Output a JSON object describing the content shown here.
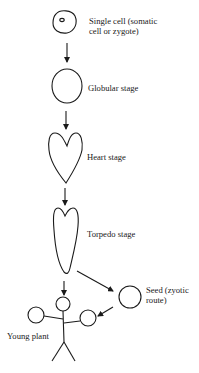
{
  "diagram": {
    "type": "flow",
    "title": "",
    "stages": [
      {
        "id": "single-cell",
        "label_lines": [
          "Single cell (somatic",
          "cell or zygote)"
        ]
      },
      {
        "id": "globular",
        "label_lines": [
          "Globular stage"
        ]
      },
      {
        "id": "heart",
        "label_lines": [
          "Heart stage"
        ]
      },
      {
        "id": "torpedo",
        "label_lines": [
          "Torpedo stage"
        ]
      },
      {
        "id": "seed",
        "label_lines": [
          "Seed (zyotic",
          "route)"
        ]
      },
      {
        "id": "young-plant",
        "label_lines": [
          "Young plant"
        ]
      }
    ],
    "edges": [
      {
        "from": "single-cell",
        "to": "globular"
      },
      {
        "from": "globular",
        "to": "heart"
      },
      {
        "from": "heart",
        "to": "torpedo"
      },
      {
        "from": "torpedo",
        "to": "young-plant"
      },
      {
        "from": "torpedo",
        "to": "seed"
      },
      {
        "from": "seed",
        "to": "young-plant"
      }
    ],
    "colors": {
      "stroke": "#1a1a1a",
      "background": "#ffffff"
    }
  }
}
